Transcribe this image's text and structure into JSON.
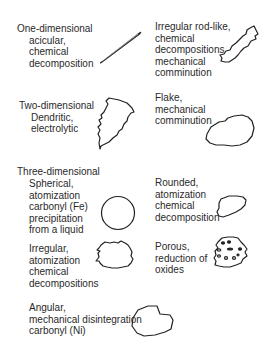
{
  "groups": {
    "one_dimensional": {
      "heading": "One-dimensional",
      "lines": [
        "acicular,",
        "chemical",
        "decomposition"
      ],
      "shape": "needle-icon"
    },
    "irregular_rod": {
      "lines": [
        "Irregular rod-like,",
        "chemical",
        "decompositions",
        "mechanical",
        "comminution"
      ],
      "shape": "irregular-rod-icon"
    },
    "two_dimensional": {
      "heading": "Two-dimensional",
      "lines": [
        "Dendritic,",
        "electrolytic"
      ],
      "shape": "dendritic-icon"
    },
    "flake": {
      "lines": [
        "Flake,",
        "mechanical",
        "comminution"
      ],
      "shape": "flake-icon"
    },
    "three_dimensional": {
      "heading": "Three-dimensional",
      "spherical": {
        "lines": [
          "Spherical,",
          "atomization",
          "carbonyl (Fe)",
          "precipitation",
          "from a liquid"
        ],
        "shape": "sphere-icon"
      },
      "rounded": {
        "lines": [
          "Rounded,",
          "atomization",
          "chemical",
          "decomposition"
        ],
        "shape": "rounded-icon"
      },
      "irregular": {
        "lines": [
          "Irregular,",
          "atomization",
          "chemical",
          "decompositions"
        ],
        "shape": "irregular-icon"
      },
      "porous": {
        "lines": [
          "Porous,",
          "reduction of",
          "oxides"
        ],
        "shape": "porous-icon"
      },
      "angular": {
        "lines": [
          "Angular,",
          "mechanical disintegration",
          "carbonyl (Ni)"
        ],
        "shape": "angular-icon"
      }
    }
  }
}
